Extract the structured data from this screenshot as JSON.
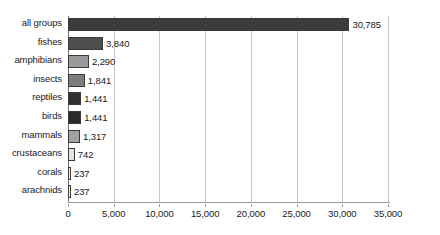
{
  "chart_data": {
    "type": "bar",
    "orientation": "horizontal",
    "title": "",
    "xlabel": "",
    "ylabel": "",
    "xlim": [
      0,
      35000
    ],
    "grid": true,
    "legend": "none",
    "xticks": [
      0,
      5000,
      10000,
      15000,
      20000,
      25000,
      30000,
      35000
    ],
    "xtick_labels": [
      "0",
      "5,000",
      "10,000",
      "15,000",
      "20,000",
      "25,000",
      "30,000",
      "35,000"
    ],
    "categories": [
      "all groups",
      "fishes",
      "amphibians",
      "insects",
      "reptiles",
      "birds",
      "mammals",
      "crustaceans",
      "corals",
      "arachnids"
    ],
    "values": [
      30785,
      3840,
      2290,
      1841,
      1441,
      1441,
      1317,
      742,
      237,
      237
    ],
    "value_labels": [
      "30,785",
      "3,840",
      "2,290",
      "1,841",
      "1,441",
      "1,441",
      "1,317",
      "742",
      "237",
      "237"
    ],
    "bar_colors": [
      "#3b3b3b",
      "#4f4f4f",
      "#9a9a9a",
      "#7d7d7d",
      "#2f2f2f",
      "#2b2b2b",
      "#a2a2a2",
      "#e2e2e2",
      "#f2f2f2",
      "#f2f2f2"
    ]
  },
  "style": {
    "bar_border_color": "#3a3a3a",
    "gridline_color": "#c8c8c8",
    "axis_color": "#6d6d6d",
    "baseline_color": "#9a9a9a",
    "text_color": "#1a1a1a",
    "background": "#ffffff"
  },
  "header_remnant": "∙∙  ∙∙∙"
}
